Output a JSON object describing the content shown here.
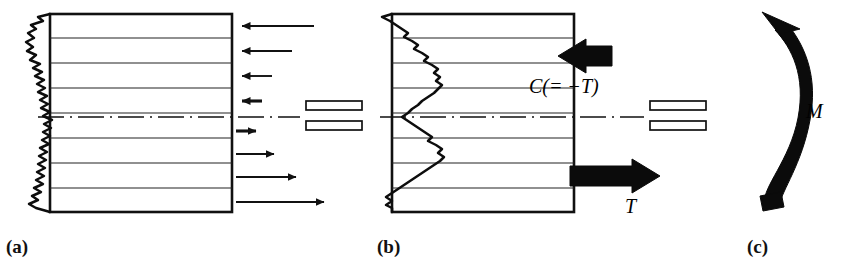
{
  "figure": {
    "type": "engineering-diagram",
    "background_color": "#ffffff",
    "ink_color": "#000000"
  },
  "panels": [
    {
      "id": "a",
      "label": "(a)",
      "description": "Cross-section with jagged residual-stress trace on left edge and distributed stress arrows on right edge",
      "has_centerline": true,
      "arrow_style": "thin-line",
      "arrows": [
        {
          "index": 1,
          "direction": "left",
          "length": 78
        },
        {
          "index": 2,
          "direction": "left",
          "length": 56
        },
        {
          "index": 3,
          "direction": "left",
          "length": 36
        },
        {
          "index": 4,
          "direction": "left",
          "length": 16
        },
        {
          "index": 5,
          "direction": "right",
          "length": 16
        },
        {
          "index": 6,
          "direction": "right",
          "length": 38
        },
        {
          "index": 7,
          "direction": "right",
          "length": 60
        },
        {
          "index": 8,
          "direction": "right",
          "length": 88
        }
      ]
    },
    {
      "id": "b",
      "label": "(b)",
      "description": "Same cross-section replaced by two equal and opposite resultant forces forming a couple",
      "has_centerline": true,
      "arrow_style": "thick-block",
      "arrows": [
        {
          "index": 1,
          "direction": "left",
          "label": "C(= −T)"
        },
        {
          "index": 2,
          "direction": "right",
          "label": "T"
        }
      ]
    },
    {
      "id": "c",
      "label": "(c)",
      "description": "Couple replaced by an equivalent bending moment drawn as a thick curved arrow",
      "arrow_style": "curved-thick",
      "moment_label": "M",
      "rotation_sense": "counterclockwise"
    }
  ],
  "labels": {
    "panel_a": "(a)",
    "panel_b": "(b)",
    "panel_c": "(c)",
    "compression_force": "C(= −T)",
    "tension_force": "T",
    "moment": "M"
  },
  "equals_signs": [
    {
      "index": 1,
      "between": [
        "a",
        "b"
      ],
      "style": "outlined-double-bar"
    },
    {
      "index": 2,
      "between": [
        "b",
        "c"
      ],
      "style": "outlined-double-bar"
    }
  ],
  "colors": {
    "ink": "#000000",
    "paper": "#ffffff",
    "hairline": "#1a1a1a"
  }
}
